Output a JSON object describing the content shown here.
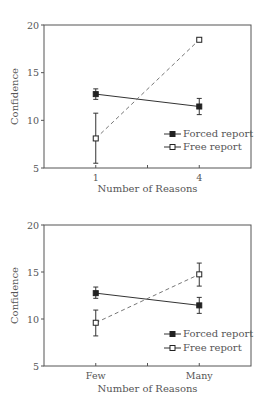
{
  "chart_data": [
    {
      "type": "line",
      "title": "",
      "xlabel": "Number of Reasons",
      "ylabel": "Confidence",
      "categories": [
        "1",
        "4"
      ],
      "ylim": [
        5,
        20
      ],
      "yticks": [
        5,
        10,
        15,
        20
      ],
      "grid": false,
      "legend_position": "bottom-right",
      "series": [
        {
          "name": "Forced report",
          "marker": "filled-square",
          "line_style": "solid",
          "values": [
            12.75,
            11.45
          ],
          "error_low": [
            12.2,
            10.6
          ],
          "error_high": [
            13.3,
            12.3
          ]
        },
        {
          "name": "Free report",
          "marker": "open-square",
          "line_style": "dashed",
          "values": [
            8.1,
            18.45
          ],
          "error_low": [
            5.5,
            18.3
          ],
          "error_high": [
            10.75,
            18.6
          ]
        }
      ]
    },
    {
      "type": "line",
      "title": "",
      "xlabel": "Number of Reasons",
      "ylabel": "Confidence",
      "categories": [
        "Few",
        "Many"
      ],
      "ylim": [
        5,
        20
      ],
      "yticks": [
        5,
        10,
        15,
        20
      ],
      "grid": false,
      "legend_position": "bottom-right",
      "series": [
        {
          "name": "Forced report",
          "marker": "filled-square",
          "line_style": "solid",
          "values": [
            12.75,
            11.45
          ],
          "error_low": [
            12.2,
            10.6
          ],
          "error_high": [
            13.4,
            12.3
          ]
        },
        {
          "name": "Free report",
          "marker": "open-square",
          "line_style": "dashed",
          "values": [
            9.6,
            14.75
          ],
          "error_low": [
            8.2,
            13.5
          ],
          "error_high": [
            10.95,
            15.95
          ]
        }
      ]
    }
  ],
  "colors": {
    "axis": "#555555",
    "line": "#333333",
    "dashed": "#777777"
  }
}
